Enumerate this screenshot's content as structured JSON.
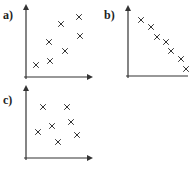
{
  "chart_data": [
    {
      "type": "scatter",
      "label": "a)",
      "title": "",
      "xlabel": "",
      "ylabel": "",
      "grid": false,
      "marker": "x",
      "description": "positive correlation",
      "points": [
        {
          "x": 1.0,
          "y": 1.2
        },
        {
          "x": 2.4,
          "y": 1.6
        },
        {
          "x": 2.3,
          "y": 3.5
        },
        {
          "x": 3.5,
          "y": 5.3
        },
        {
          "x": 3.9,
          "y": 2.6
        },
        {
          "x": 5.3,
          "y": 6.0
        },
        {
          "x": 5.4,
          "y": 4.1
        }
      ]
    },
    {
      "type": "scatter",
      "label": "b)",
      "title": "",
      "xlabel": "",
      "ylabel": "",
      "grid": false,
      "marker": "x",
      "description": "strong negative correlation",
      "points": [
        {
          "x": 1.3,
          "y": 5.6
        },
        {
          "x": 2.3,
          "y": 4.9
        },
        {
          "x": 2.9,
          "y": 3.9
        },
        {
          "x": 3.8,
          "y": 3.4
        },
        {
          "x": 4.3,
          "y": 2.5
        },
        {
          "x": 5.3,
          "y": 1.7
        },
        {
          "x": 5.8,
          "y": 0.7
        }
      ]
    },
    {
      "type": "scatter",
      "label": "c)",
      "title": "",
      "xlabel": "",
      "ylabel": "",
      "grid": false,
      "marker": "x",
      "description": "no correlation",
      "points": [
        {
          "x": 1.7,
          "y": 5.1
        },
        {
          "x": 4.1,
          "y": 5.1
        },
        {
          "x": 1.2,
          "y": 2.6
        },
        {
          "x": 2.6,
          "y": 3.2
        },
        {
          "x": 4.5,
          "y": 3.6
        },
        {
          "x": 5.1,
          "y": 2.3
        },
        {
          "x": 3.2,
          "y": 1.6
        }
      ]
    }
  ],
  "panels": [
    {
      "label": "a)"
    },
    {
      "label": "b)"
    },
    {
      "label": "c)"
    }
  ]
}
